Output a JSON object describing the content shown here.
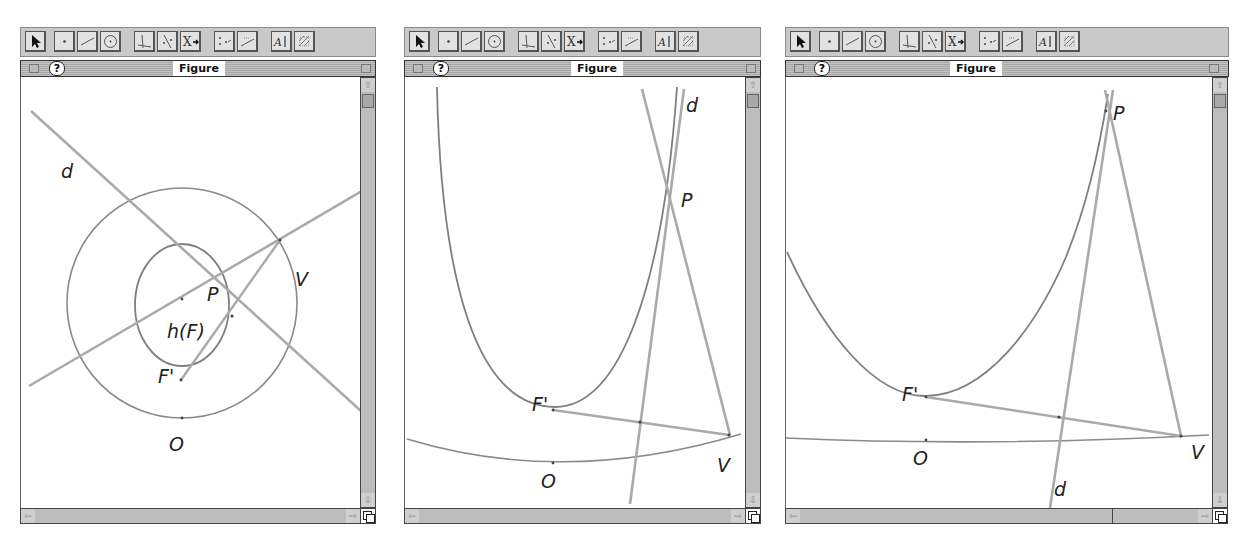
{
  "windows": [
    {
      "title": "Figure",
      "help_label": "?",
      "labels": {
        "d": "d",
        "P": "P",
        "V": "V",
        "hF": "h(F)",
        "Fp": "F'",
        "O": "O"
      }
    },
    {
      "title": "Figure",
      "help_label": "?",
      "labels": {
        "d": "d",
        "P": "P",
        "V": "V",
        "Fp": "F'",
        "O": "O"
      }
    },
    {
      "title": "Figure",
      "help_label": "?",
      "labels": {
        "d": "d",
        "P": "P",
        "V": "V",
        "Fp": "F'",
        "O": "O"
      }
    }
  ],
  "toolbar": {
    "tools": [
      {
        "name": "pointer-tool"
      },
      {
        "name": "point-tool"
      },
      {
        "name": "line-tool"
      },
      {
        "name": "circle-tool"
      },
      {
        "name": "perpendicular-tool"
      },
      {
        "name": "symmetry-tool"
      },
      {
        "name": "transform-tool"
      },
      {
        "name": "locus-tool"
      },
      {
        "name": "measure-tool"
      },
      {
        "name": "text-tool"
      },
      {
        "name": "appearance-tool"
      }
    ]
  },
  "scroll_arrows": {
    "up": "⇧",
    "down": "⇩",
    "left": "⇦",
    "right": "⇨"
  },
  "colors": {
    "stroke": "#8c8c8c",
    "line": "#aaaaaa",
    "curve": "#7f7f7f"
  }
}
